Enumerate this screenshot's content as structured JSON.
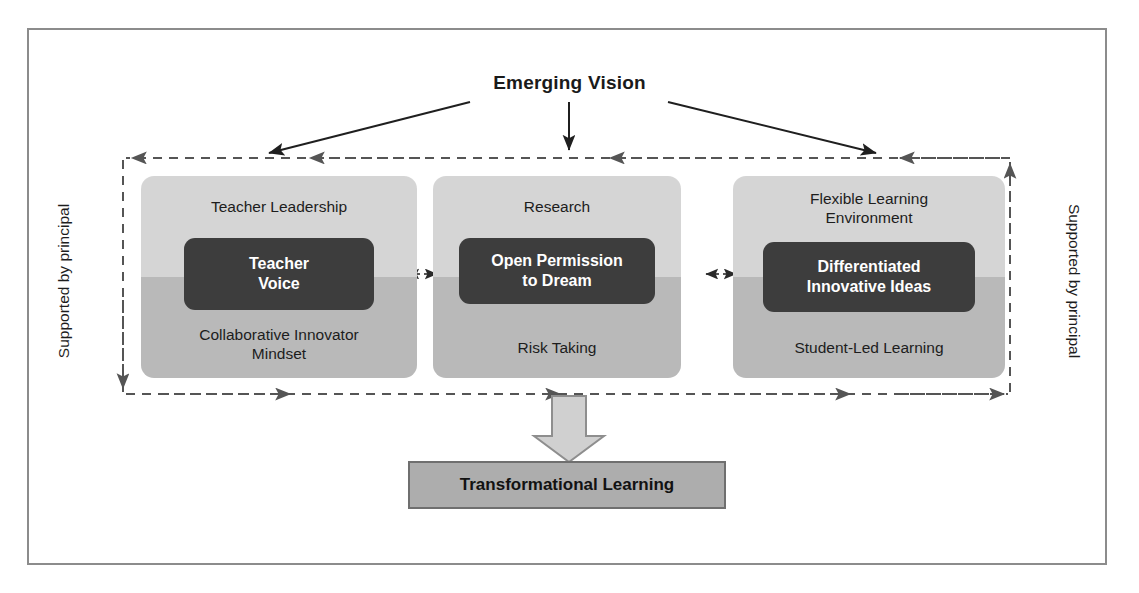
{
  "diagram": {
    "title": "Emerging Vision",
    "outcome": "Transformational Learning",
    "side_label_left": "Supported by principal",
    "side_label_right": "Supported by principal",
    "pillars": [
      {
        "top_label": "Teacher Leadership",
        "core": "Teacher Voice",
        "core_line1": "Teacher",
        "core_line2": "Voice",
        "bottom_label": "Collaborative Innovator Mindset",
        "bottom_line1": "Collaborative Innovator",
        "bottom_line2": "Mindset"
      },
      {
        "top_label": "Research",
        "core": "Open Permission to Dream",
        "core_line1": "Open Permission",
        "core_line2": "to Dream",
        "bottom_label": "Risk Taking",
        "bottom_line1": "Risk Taking",
        "bottom_line2": ""
      },
      {
        "top_label": "Flexible Learning Environment",
        "top_line1": "Flexible Learning",
        "top_line2": "Environment",
        "core": "Differentiated Innovative Ideas",
        "core_line1": "Differentiated",
        "core_line2": "Innovative Ideas",
        "bottom_label": "Student-Led Learning",
        "bottom_line1": "Student-Led Learning",
        "bottom_line2": ""
      }
    ]
  },
  "colors": {
    "frame_border": "#8c8c8c",
    "panel_top": "#d5d5d5",
    "panel_bottom": "#b9b9b9",
    "core_box": "#3d3d3d",
    "core_text": "#ffffff",
    "result_box": "#adadad",
    "result_border": "#6f6f6f",
    "arrow_solid": "#1f1f1f",
    "arrow_dashed": "#555555",
    "big_arrow_fill": "#d0d0d0",
    "text": "#1d1d1d"
  }
}
